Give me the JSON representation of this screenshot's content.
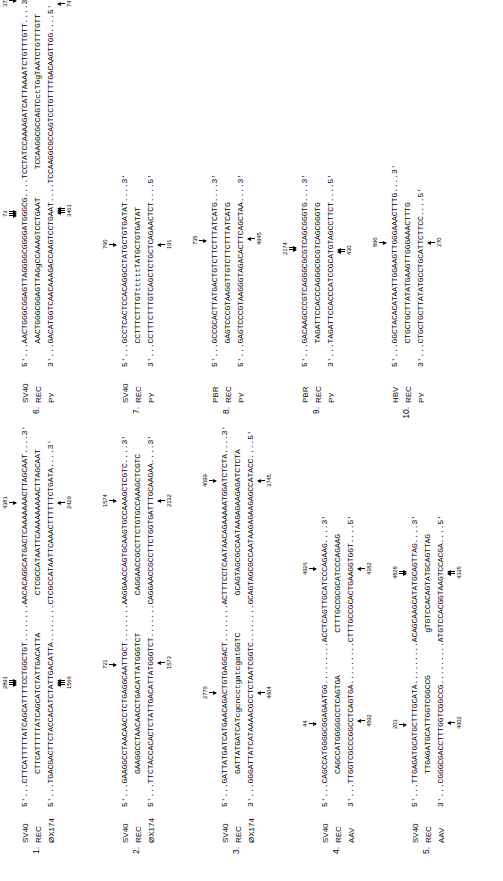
{
  "blocks": [
    {
      "index": "1.",
      "names": [
        "SV40",
        "REC",
        "ØX174"
      ],
      "rows": [
        "5'...CTTCATTTTTATCAGCATTTTCCTGGCTGT........AACACAGGCATGACTCAAAAAAACTTAGCAAT....3'",
        "       CTTCATTTTTATCAGCATCTATTGACATTA        CTCGCCATAATTCAAAAAAAAACTTAGCAAT",
        "5'...TGACGACTTCTACCACATCTATTGACATTA........CTCGCCATAATTCAAACTTTTTTCTGATA....3'"
      ],
      "marks_top": [
        {
          "num": "2891",
          "arrows": 3,
          "dir": "down",
          "left": 118
        },
        {
          "num": "4381",
          "arrows": 1,
          "dir": "down",
          "left": 298
        }
      ],
      "marks_bottom": [
        {
          "num": "1566",
          "arrows": 3,
          "dir": "up",
          "left": 118
        },
        {
          "num": "2429",
          "arrows": 1,
          "dir": "up",
          "left": 298
        }
      ]
    },
    {
      "index": "2.",
      "names": [
        "SV40",
        "REC",
        "ØX174"
      ],
      "rows": [
        "5'...GAAGGCCTAACAACCTCTGAGGCAATTGCT........AAGGAACCAGTGCAAGTGCCAAAGCTCGTC....3'",
        "       GAAGGCCTAACAACCTGACATTATGGGTCT        CAGGAACCGCCTTCTGTGCCAAAGCTCGTC",
        "5'...TTCTACCACACTCTATTGACATTATGGGTCT.......CAGGAACCGCCTTCTGGTGATTTGCAAGAA....3'"
      ],
      "marks_top": [
        {
          "num": "721",
          "arrows": 1,
          "dir": "down",
          "left": 138
        },
        {
          "num": "1574",
          "arrows": 1,
          "dir": "down",
          "left": 300
        }
      ],
      "marks_bottom": [
        {
          "num": "1573",
          "arrows": 1,
          "dir": "up",
          "left": 138
        },
        {
          "num": "2132",
          "arrows": 1,
          "dir": "up",
          "left": 300
        }
      ]
    },
    {
      "index": "3.",
      "names": [
        "SV40",
        "REC",
        "ØX174"
      ],
      "rows": [
        "5'...GATTATGATCATGAACAGACTGTGAGGACT........ACTTTCCTCAATAACAGAAAAATGGATCTCTA....3'",
        "       GATTATGATCATcgcncctgatcgatGGTC        GCAGTAGCGCCAATAAGAGAAGAGATCTCTA",
        "3'...GGGATTATCATAAAACGCCTCTAATCGGTC........GCAGTAGCGCCAATAAGAGAAGAGCCATACC....5'"
      ],
      "marks_top": [
        {
          "num": "2776",
          "arrows": 1,
          "dir": "down",
          "left": 108
        },
        {
          "num": "4099",
          "arrows": 1,
          "dir": "down",
          "left": 320
        }
      ],
      "marks_bottom": [
        {
          "num": "4604",
          "arrows": 1,
          "dir": "up",
          "left": 108
        },
        {
          "num": "3745",
          "arrows": 1,
          "dir": "up",
          "left": 320
        }
      ]
    },
    {
      "index": "4.",
      "names": [
        "SV40",
        "REC",
        "AAV"
      ],
      "rows": [
        "5'...CAGCCATGGGGCGGAGAATGG.........ACCTCAGTTGCATCCCAGAAG....3'",
        "       CAGCCATGGGGGCCTCAGTGA         CTTTGCCGCGCATCCCAGAAG",
        "3'...TTGGTCGCCCGGCCTCAGTGA.........CTTTGCCGCACTGAAGGTGGT....5'"
      ],
      "marks_top": [
        {
          "num": "44",
          "arrows": 1,
          "dir": "down",
          "left": 80
        },
        {
          "num": "4926",
          "arrows": 1,
          "dir": "down",
          "left": 232
        }
      ],
      "marks_bottom": [
        {
          "num": "4592",
          "arrows": 1,
          "dir": "up",
          "left": 80
        },
        {
          "num": "4182",
          "arrows": 1,
          "dir": "up",
          "left": 232
        }
      ]
    },
    {
      "index": "5.",
      "names": [
        "SV40",
        "REC",
        "AAV"
      ],
      "rows": [
        "5'...TTGAGATGCATGCTTTGCATA.........ACAGCAAGCATATGCAGTTAG....3'",
        "       TTGAGATGCATTGGTCGGCCG         gTGTCCACAGTATGCAGTTAG",
        "3'...CGGGCGACCTTTGGTCGGCCG.........ATGTCCACGGTAAGTCCACGA....5'"
      ],
      "marks_top": [
        {
          "num": "203",
          "arrows": 1,
          "dir": "down",
          "left": 78
        },
        {
          "num": "4828",
          "arrows": 2,
          "dir": "down",
          "left": 228
        }
      ],
      "marks_bottom": [
        {
          "num": "4602",
          "arrows": 1,
          "dir": "up",
          "left": 78
        },
        {
          "num": "4335",
          "arrows": 2,
          "dir": "up",
          "left": 228
        }
      ]
    },
    {
      "index": "6.",
      "names": [
        "SV40",
        "REC",
        "PY"
      ],
      "rows": [
        "5'...AACTGGGCGGAGTTAGGGGCGGGGATGGGCG....TCCTATCCAAAAGATCATTAAAATCTGTTTGTT....3'",
        "     AACTGGGCGGAGTTAGgCCAAAGTCCTGAAT      TCCAAGGCGCCAGTCctTGgTAATCTGTTTGTT",
        "3'...GACATGGTCAACAAAGACCAAGTCCTGAAT....TCCAAGGCGCCAGTCCTGTTTTGACAAGTTGG....5'"
      ],
      "marks_top": [
        {
          "num": "73",
          "arrows": 3,
          "dir": "down",
          "left": 150
        },
        {
          "num": "3723",
          "arrows": 1,
          "dir": "down",
          "left": 360
        }
      ],
      "marks_bottom": [
        {
          "num": "3461",
          "arrows": 3,
          "dir": "up",
          "left": 150
        },
        {
          "num": "74",
          "arrows": 1,
          "dir": "up",
          "left": 360
        }
      ]
    },
    {
      "index": "7.",
      "names": [
        "SV40",
        "REC",
        "PY"
      ],
      "rows": [
        "5'...GCCTCACTCCACAGGCCTATGCTGTGATAT....3'",
        "     CCTTTCTTTGTtttttTATGCTGTGATAT",
        "3'...CCTTTCTTTGTCAGCTCTGCTCAGAACTCT....5'"
      ],
      "marks_top": [
        {
          "num": "760",
          "arrows": 1,
          "dir": "down",
          "left": 118
        }
      ],
      "marks_bottom": [
        {
          "num": "191",
          "arrows": 1,
          "dir": "up",
          "left": 118
        }
      ]
    },
    {
      "index": "8.",
      "names": [
        "PBR",
        "REC",
        "PY"
      ],
      "rows": [
        "5'...GCCGCACTTATGACTGTCTTCTTTATCATG....3'",
        "     GAGTCCCGTAAGGTTGTCTTCTTTATCATG",
        "5'...GAGTCCCGTAAGGGTAGACACTTCAGCTAA....3'"
      ],
      "marks_top": [
        {
          "num": "735",
          "arrows": 1,
          "dir": "down",
          "left": 122
        }
      ],
      "marks_bottom": [
        {
          "num": "4945",
          "arrows": 1,
          "dir": "up",
          "left": 122
        }
      ]
    },
    {
      "index": "9.",
      "names": [
        "PBR",
        "REC",
        "PY"
      ],
      "rows": [
        "5'...GACAAGCCCGTCAGGGCGCGTCAGCGGGTG....3'",
        "     TAGATTCCACCCAGGGCGCGTCAGCGGGTG",
        "3'...TAGATTCCACCCATCCGCATGTAGCCTTCT....5'"
      ],
      "marks_top": [
        {
          "num": "2174",
          "arrows": 2,
          "dir": "down",
          "left": 112
        }
      ],
      "marks_bottom": [
        {
          "num": "430",
          "arrows": 2,
          "dir": "up",
          "left": 112
        }
      ]
    },
    {
      "index": "10.",
      "names": [
        "HBV",
        "REC",
        "PY"
      ],
      "rows": [
        "5'...GGCTACACATAATTGGAAGTTGGGAAACTTTG....3'",
        "     CTGCTGCTTATATGAAGTTGGGAAACTTTG",
        "3'...CTGCTGCTTATATGCCTGCATTCTTCC....5'"
      ],
      "marks_top": [
        {
          "num": "896",
          "arrows": 1,
          "dir": "down",
          "left": 120
        }
      ],
      "marks_bottom": [
        {
          "num": "270",
          "arrows": 1,
          "dir": "up",
          "left": 120
        }
      ]
    }
  ]
}
